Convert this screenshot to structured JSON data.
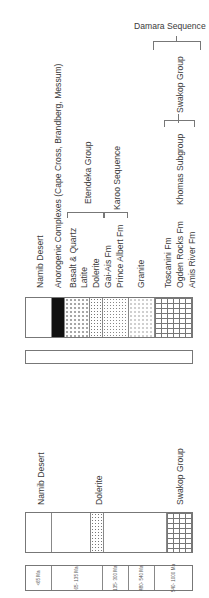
{
  "header": {
    "damara_label": "Damara Sequence"
  },
  "upper_column": {
    "labels": [
      "Namib Desert",
      "Anorogenic Complexes (Cape Cross, Brandberg, Messum)",
      "Basalt & Quartz",
      "Latite",
      "Dolerite",
      "Gai-Ais Fm",
      "Prince Albert Fm",
      "Granite",
      "Toscanini Fm",
      "Ogden Rocks Fm",
      "Amis River Fm"
    ],
    "groups": {
      "etendeka": "Etendeka Group",
      "karoo": "Karoo Sequence",
      "khomas": "Khomas Subgroup",
      "swakop": "Swakop Group"
    }
  },
  "lower_column": {
    "labels": [
      "Namib Desert",
      "Dolerite",
      "Swakop Group"
    ]
  },
  "ages": [
    {
      "label": "<65 Ma"
    },
    {
      "label": "65- 135 Ma"
    },
    {
      "label": "135- 300 Ma"
    },
    {
      "label": "480- 540 Ma"
    },
    {
      "label": "540- 1000 Ma"
    }
  ],
  "colors": {
    "line": "#777777",
    "text": "#3a3a3a",
    "fill_black": "#111111"
  }
}
